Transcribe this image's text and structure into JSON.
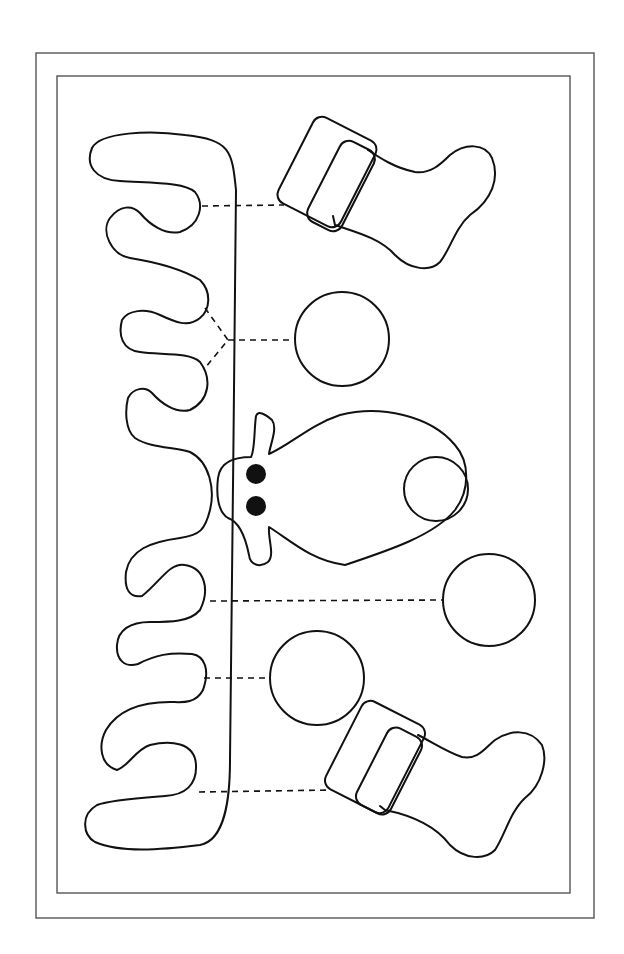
{
  "page": {
    "background": "#ffffff",
    "ink_color": "#111111",
    "frame_color": "#555555"
  },
  "template": {
    "frames": [
      "outer-border",
      "inner-border"
    ],
    "pieces": [
      {
        "id": "garland",
        "type": "wavy-strip",
        "label": "garland strip"
      },
      {
        "id": "stocking-top",
        "type": "stocking",
        "label": "stocking with cuff"
      },
      {
        "id": "ornament-1",
        "type": "circle",
        "label": "round ornament"
      },
      {
        "id": "moose-head",
        "type": "moose",
        "label": "moose head",
        "eyes": 2,
        "features": [
          "ears",
          "nose-circle"
        ]
      },
      {
        "id": "ornament-2",
        "type": "circle",
        "label": "round ornament"
      },
      {
        "id": "ornament-3",
        "type": "circle",
        "label": "round ornament"
      },
      {
        "id": "stocking-bottom",
        "type": "stocking",
        "label": "stocking with cuff"
      }
    ],
    "connectors": [
      {
        "from": "garland",
        "to": "stocking-top",
        "style": "dashed"
      },
      {
        "from": "garland",
        "to": "ornament-1",
        "style": "dashed-forked"
      },
      {
        "from": "garland",
        "to": "ornament-2",
        "style": "dashed"
      },
      {
        "from": "garland",
        "to": "ornament-3",
        "style": "dashed"
      },
      {
        "from": "garland",
        "to": "stocking-bottom",
        "style": "dashed"
      }
    ]
  }
}
